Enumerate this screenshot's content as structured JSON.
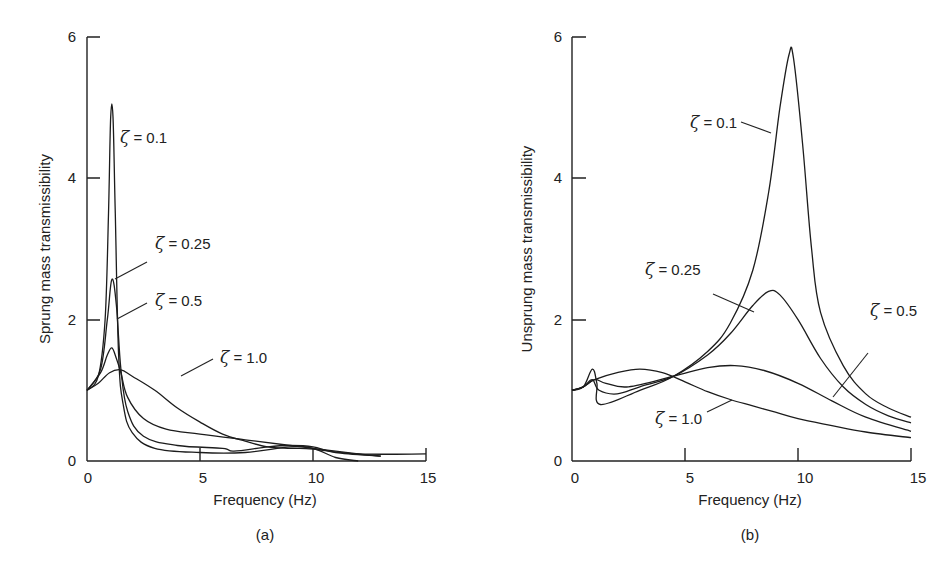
{
  "chart_data": [
    {
      "type": "line",
      "panel": "(a)",
      "title": "",
      "xlabel": "Frequency (Hz)",
      "ylabel": "Sprung mass transmissibility",
      "xlim": [
        0,
        15
      ],
      "ylim": [
        0,
        6
      ],
      "xticks": [
        "0",
        "5",
        "10",
        "15"
      ],
      "yticks": [
        "0",
        "2",
        "4",
        "6"
      ],
      "grid": false,
      "legend": "inline labels",
      "series": [
        {
          "name": "ζ = 0.1",
          "label_value": "0.1",
          "x": [
            0,
            0.5,
            0.8,
            0.95,
            1.05,
            1.15,
            1.25,
            1.4,
            1.6,
            2,
            3,
            5,
            7,
            9,
            10,
            11,
            12
          ],
          "y": [
            1.0,
            1.2,
            2.0,
            3.5,
            4.87,
            4.87,
            3.5,
            1.5,
            0.8,
            0.4,
            0.18,
            0.12,
            0.12,
            0.2,
            0.18,
            0.05,
            0.0
          ]
        },
        {
          "name": "ζ = 0.25",
          "label_value": "0.25",
          "x": [
            0,
            0.6,
            0.9,
            1.1,
            1.3,
            1.5,
            1.8,
            2.5,
            4,
            6,
            6.5,
            8,
            9,
            10,
            11,
            13
          ],
          "y": [
            1.0,
            1.3,
            2.0,
            2.57,
            2.2,
            1.3,
            0.7,
            0.35,
            0.22,
            0.18,
            0.14,
            0.2,
            0.22,
            0.2,
            0.12,
            0.07
          ]
        },
        {
          "name": "ζ = 0.5",
          "label_value": "0.5",
          "x": [
            0,
            0.6,
            0.9,
            1.1,
            1.3,
            1.5,
            1.8,
            2.5,
            3.5,
            5,
            7,
            9,
            10,
            12,
            13
          ],
          "y": [
            1.0,
            1.25,
            1.5,
            1.6,
            1.45,
            1.25,
            0.9,
            0.6,
            0.45,
            0.38,
            0.3,
            0.22,
            0.18,
            0.1,
            0.07
          ]
        },
        {
          "name": "ζ = 1.0",
          "label_value": "1.0",
          "x": [
            0,
            0.5,
            1,
            1.5,
            2,
            3,
            4,
            5,
            6,
            7,
            8,
            9,
            10,
            12,
            15
          ],
          "y": [
            1.0,
            1.1,
            1.25,
            1.29,
            1.2,
            1.0,
            0.75,
            0.55,
            0.38,
            0.28,
            0.2,
            0.18,
            0.17,
            0.1,
            0.1
          ]
        }
      ]
    },
    {
      "type": "line",
      "panel": "(b)",
      "title": "",
      "xlabel": "Frequency (Hz)",
      "ylabel": "Unsprung mass transmissibility",
      "xlim": [
        0,
        15
      ],
      "ylim": [
        0,
        6
      ],
      "xticks": [
        "0",
        "5",
        "10",
        "15"
      ],
      "yticks": [
        "0",
        "2",
        "4",
        "6"
      ],
      "grid": false,
      "legend": "inline labels",
      "series": [
        {
          "name": "ζ = 0.1",
          "label_value": "0.1",
          "x": [
            0,
            0.5,
            0.9,
            1.1,
            1.25,
            3,
            4.5,
            6,
            7,
            8,
            8.7,
            9.2,
            9.6,
            9.8,
            10.2,
            10.6,
            11,
            12,
            13,
            14,
            15
          ],
          "y": [
            1.0,
            1.05,
            1.3,
            1.1,
            0.8,
            1.0,
            1.2,
            1.55,
            1.95,
            2.7,
            3.8,
            5.0,
            5.75,
            5.7,
            4.5,
            3.0,
            2.1,
            1.35,
            0.95,
            0.75,
            0.62
          ]
        },
        {
          "name": "ζ = 0.25",
          "label_value": "0.25",
          "x": [
            0,
            0.5,
            0.9,
            1.2,
            2,
            3,
            4.5,
            6,
            7,
            8,
            8.7,
            9.2,
            10,
            11,
            12,
            13,
            14,
            15
          ],
          "y": [
            1.0,
            1.05,
            1.15,
            1.0,
            0.95,
            1.05,
            1.2,
            1.5,
            1.8,
            2.2,
            2.4,
            2.35,
            2.0,
            1.45,
            1.05,
            0.8,
            0.64,
            0.54
          ]
        },
        {
          "name": "ζ = 0.5",
          "label_value": "0.5",
          "x": [
            0,
            0.5,
            1,
            1.5,
            2.5,
            4.5,
            6,
            7.2,
            8.5,
            10,
            11.5,
            13,
            15
          ],
          "y": [
            1.0,
            1.05,
            1.15,
            1.1,
            1.05,
            1.2,
            1.32,
            1.35,
            1.28,
            1.1,
            0.85,
            0.62,
            0.42
          ]
        },
        {
          "name": "ζ = 1.0",
          "label_value": "1.0",
          "x": [
            0,
            0.5,
            1,
            2,
            3,
            4,
            5,
            6,
            7,
            8,
            9,
            10,
            11.5,
            13,
            15
          ],
          "y": [
            1.0,
            1.05,
            1.15,
            1.25,
            1.3,
            1.25,
            1.12,
            0.98,
            0.87,
            0.78,
            0.69,
            0.6,
            0.5,
            0.41,
            0.33
          ]
        }
      ]
    }
  ],
  "panels": {
    "a": {
      "caption": "(a)",
      "xlabel": "Frequency (Hz)",
      "ylabel": "Sprung mass transmissibility",
      "xticks": [
        "0",
        "5",
        "10",
        "15"
      ],
      "yticks": [
        "0",
        "2",
        "4",
        "6"
      ],
      "labels": [
        {
          "symbol": "ζ",
          "text": " = 0.1"
        },
        {
          "symbol": "ζ",
          "text": " = 0.25"
        },
        {
          "symbol": "ζ",
          "text": " = 0.5"
        },
        {
          "symbol": "ζ",
          "text": " = 1.0"
        }
      ]
    },
    "b": {
      "caption": "(b)",
      "xlabel": "Frequency (Hz)",
      "ylabel": "Unsprung mass transmissibility",
      "xticks": [
        "0",
        "5",
        "10",
        "15"
      ],
      "yticks": [
        "0",
        "2",
        "4",
        "6"
      ],
      "labels": [
        {
          "symbol": "ζ",
          "text": " = 0.1"
        },
        {
          "symbol": "ζ",
          "text": " = 0.25"
        },
        {
          "symbol": "ζ",
          "text": " = 0.5"
        },
        {
          "symbol": "ζ",
          "text": " = 1.0"
        }
      ]
    }
  },
  "colors": {
    "line": "#1c1c1c",
    "background": "#ffffff"
  }
}
